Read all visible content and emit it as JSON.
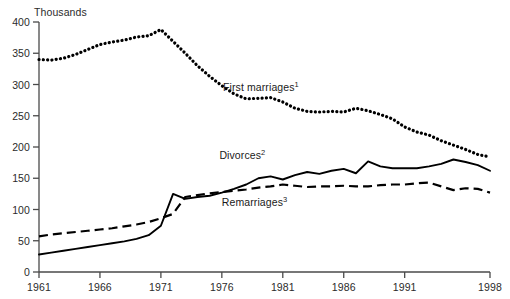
{
  "chart_data": {
    "type": "line",
    "title": "",
    "subtitle": "",
    "unit_label": "Thousands",
    "xlabel": "",
    "ylabel": "Thousands",
    "xlim": [
      1961,
      1998
    ],
    "ylim": [
      0,
      400
    ],
    "grid": false,
    "legend_position": "inline-annotations",
    "y_ticks": [
      0,
      50,
      100,
      150,
      200,
      250,
      300,
      350,
      400
    ],
    "y_tick_labels": [
      "0",
      "50",
      "100",
      "150",
      "200",
      "250",
      "300",
      "350",
      "400"
    ],
    "x_ticks": [
      1961,
      1966,
      1971,
      1976,
      1981,
      1986,
      1991,
      1998
    ],
    "x_tick_labels": [
      "1961",
      "1966",
      "1971",
      "1976",
      "1981",
      "1986",
      "1991",
      "1998"
    ],
    "x": [
      1961,
      1962,
      1963,
      1964,
      1965,
      1966,
      1967,
      1968,
      1969,
      1970,
      1971,
      1972,
      1973,
      1974,
      1975,
      1976,
      1977,
      1978,
      1979,
      1980,
      1981,
      1982,
      1983,
      1984,
      1985,
      1986,
      1987,
      1988,
      1989,
      1990,
      1991,
      1992,
      1993,
      1994,
      1995,
      1996,
      1997,
      1998
    ],
    "series": [
      {
        "name": "First marriages",
        "footnote_marker": "1",
        "style": "dotted",
        "color": "#000000",
        "label_x": 1976.1,
        "label_y": 295,
        "values": [
          340,
          339,
          342,
          348,
          356,
          364,
          368,
          371,
          376,
          378,
          388,
          369,
          350,
          330,
          313,
          298,
          285,
          277,
          278,
          279,
          272,
          262,
          257,
          256,
          257,
          256,
          262,
          258,
          252,
          245,
          232,
          224,
          219,
          210,
          203,
          196,
          188,
          184
        ]
      },
      {
        "name": "Divorces",
        "footnote_marker": "2",
        "style": "solid",
        "color": "#000000",
        "label_x": 1975.8,
        "label_y": 185,
        "values": [
          28,
          31,
          34,
          37,
          40,
          43,
          46,
          49,
          53,
          59,
          74,
          125,
          117,
          120,
          122,
          127,
          133,
          140,
          150,
          153,
          148,
          155,
          160,
          157,
          162,
          165,
          158,
          177,
          169,
          166,
          166,
          166,
          169,
          173,
          180,
          176,
          171,
          162
        ]
      },
      {
        "name": "Remarriages",
        "footnote_marker": "3",
        "style": "dashed",
        "color": "#000000",
        "label_x": 1976.0,
        "label_y": 110,
        "values": [
          57,
          60,
          62,
          64,
          66,
          68,
          70,
          73,
          76,
          80,
          86,
          93,
          120,
          123,
          126,
          128,
          130,
          132,
          135,
          137,
          140,
          138,
          136,
          137,
          137,
          138,
          137,
          137,
          139,
          140,
          140,
          142,
          143,
          137,
          131,
          134,
          133,
          127
        ]
      }
    ]
  }
}
